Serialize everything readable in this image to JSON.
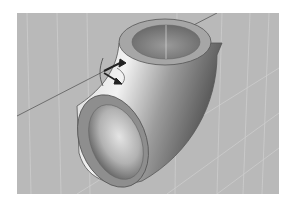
{
  "scene": {
    "description": "3D CAD viewport showing a 90-degree pipe elbow with a move/rotate gizmo on a grey grid background",
    "object": "pipe-elbow",
    "gizmo": "transform-manipulator"
  },
  "colors": {
    "background": "#b9b9b9",
    "grid_line": "#d6d6d6",
    "axis_line": "#6e6e6e",
    "rim_face": "#9a9a9a",
    "pipe_light": "#ececec",
    "pipe_mid": "#a8a8a8",
    "pipe_dark": "#5a5a5a",
    "gizmo": "#222222"
  }
}
